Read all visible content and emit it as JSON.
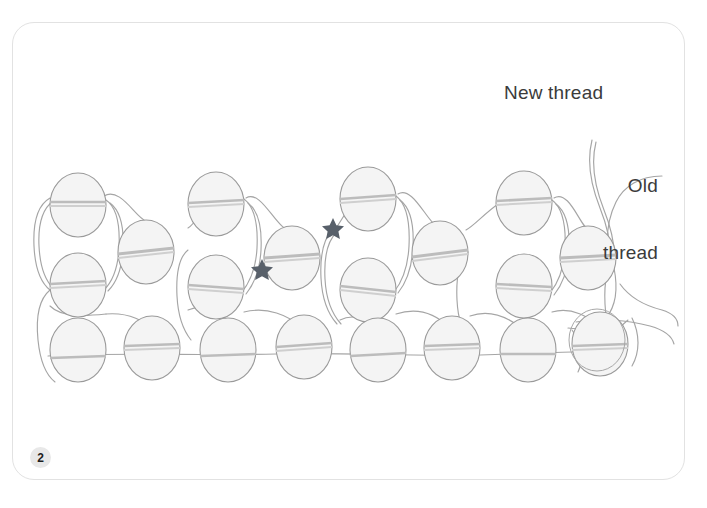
{
  "page": {
    "background_color": "#ffffff",
    "card_border_color": "#e2e2e2",
    "step_number": "2"
  },
  "labels": {
    "new_thread": "New thread",
    "old_thread_line1": "Old",
    "old_thread_line2": "thread"
  },
  "diagram": {
    "type": "peyote-stitch-beading-diagram",
    "bead_fill": "#f4f4f4",
    "bead_stroke": "#9a9a9a",
    "thread_color": "#a0a0a0",
    "hole_thread_color": "#b5b5b5",
    "star_color": "#58606a",
    "bead_rx": 28,
    "bead_ry": 32,
    "rows": [
      {
        "name": "top-row",
        "cy": 205,
        "beads": [
          {
            "cx": 78,
            "cy": 205
          },
          {
            "cx": 216,
            "cy": 204
          },
          {
            "cx": 368,
            "cy": 199
          },
          {
            "cx": 524,
            "cy": 203
          }
        ]
      },
      {
        "name": "upper-middle-row",
        "cy": 252,
        "beads": [
          {
            "cx": 146,
            "cy": 252
          },
          {
            "cx": 292,
            "cy": 258
          },
          {
            "cx": 440,
            "cy": 253
          },
          {
            "cx": 588,
            "cy": 258
          }
        ]
      },
      {
        "name": "lower-middle-row",
        "cy": 284,
        "beads": [
          {
            "cx": 78,
            "cy": 285
          },
          {
            "cx": 216,
            "cy": 287
          },
          {
            "cx": 368,
            "cy": 290
          },
          {
            "cx": 524,
            "cy": 286
          }
        ]
      },
      {
        "name": "bottom-row",
        "cy": 348,
        "beads": [
          {
            "cx": 78,
            "cy": 350
          },
          {
            "cx": 152,
            "cy": 348
          },
          {
            "cx": 228,
            "cy": 350
          },
          {
            "cx": 304,
            "cy": 347
          },
          {
            "cx": 378,
            "cy": 350
          },
          {
            "cx": 452,
            "cy": 348
          },
          {
            "cx": 528,
            "cy": 350
          },
          {
            "cx": 600,
            "cy": 344
          }
        ]
      }
    ],
    "stars": [
      {
        "name": "star-marker-left",
        "cx": 262,
        "cy": 270
      },
      {
        "name": "star-marker-right",
        "cx": 333,
        "cy": 229
      }
    ],
    "leader_lines": [
      {
        "name": "new-thread-leader",
        "from": "New thread label",
        "to": "thread tail upper right"
      },
      {
        "name": "old-thread-leader",
        "from": "Old thread label",
        "to": "thread tail mid right"
      }
    ]
  }
}
